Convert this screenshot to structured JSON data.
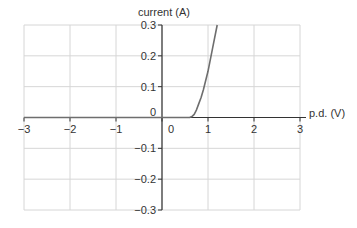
{
  "chart_data": {
    "type": "line",
    "title": "",
    "xlabel": "p.d. (V)",
    "ylabel": "current (A)",
    "xlim": [
      -3,
      3
    ],
    "ylim": [
      -0.3,
      0.3
    ],
    "x_ticks": [
      -3,
      -2,
      -1,
      0,
      1,
      2,
      3
    ],
    "x_tick_labels": [
      "−3",
      "−2",
      "−1",
      "0",
      "1",
      "2",
      "3"
    ],
    "y_ticks": [
      -0.3,
      -0.2,
      -0.1,
      0,
      0.1,
      0.2,
      0.3
    ],
    "y_tick_labels": [
      "−0.3",
      "−0.2",
      "−0.1",
      "0",
      "0.1",
      "0.2",
      "0.3"
    ],
    "grid": true,
    "legend": null,
    "series": [
      {
        "name": "diode I-V characteristic",
        "x": [
          -3,
          -2,
          -1,
          0,
          0.5,
          0.6,
          0.65,
          0.7,
          0.75,
          0.8,
          0.85,
          0.9,
          1.0,
          1.1,
          1.2
        ],
        "y": [
          0,
          0,
          0,
          0,
          0,
          0,
          0.003,
          0.01,
          0.025,
          0.045,
          0.065,
          0.09,
          0.15,
          0.225,
          0.3
        ]
      }
    ],
    "colors": {
      "curve": "#6e6e6e",
      "axes": "#333333",
      "grid": "#d6d6d6",
      "background": "#ffffff"
    }
  }
}
